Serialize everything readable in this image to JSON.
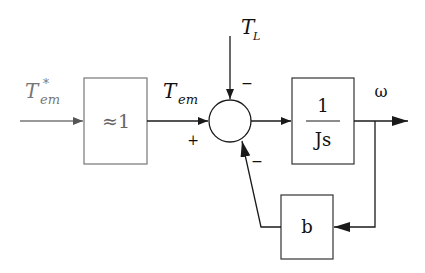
{
  "diagram": {
    "type": "block-diagram",
    "input": {
      "symbol": "T",
      "subscript": "em",
      "superscript": "*",
      "color": "#777777"
    },
    "blocks": [
      {
        "id": "gain",
        "label": "≈1"
      },
      {
        "id": "plant",
        "numerator": "1",
        "denominator": "Js"
      },
      {
        "id": "damping",
        "label": "b"
      }
    ],
    "summing_junction": {
      "signs": {
        "left": "+",
        "top": "−",
        "bottom": "−"
      }
    },
    "signals": {
      "electromagnetic_torque": {
        "symbol": "T",
        "subscript": "em"
      },
      "load_torque": {
        "symbol": "T",
        "subscript": "L"
      },
      "output": {
        "symbol": "ω"
      }
    },
    "colors": {
      "line": "#1a1a1a",
      "box_stroke": "#555555",
      "input_line": "#777777"
    }
  }
}
